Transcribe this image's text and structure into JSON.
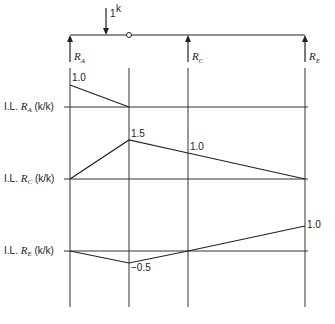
{
  "diagram": {
    "type": "influence-lines",
    "beam": {
      "load_label": "1",
      "load_unit": "k",
      "supports": [
        {
          "id": "A",
          "label": "R",
          "sub": "A",
          "x": 70
        },
        {
          "id": "C",
          "label": "R",
          "sub": "C",
          "x": 188
        },
        {
          "id": "E",
          "label": "R",
          "sub": "E",
          "x": 305
        }
      ],
      "hinge_x": 129,
      "load_x": 106
    },
    "influence_lines": [
      {
        "name": "RA",
        "label_prefix": "I.L.",
        "label_var": "R",
        "label_sub": "A",
        "label_unit": "(k/k)",
        "points": [
          {
            "pos": "A",
            "value": 1.0,
            "label": "1.0"
          },
          {
            "pos": "B-hinge",
            "value": 0.0
          },
          {
            "pos": "C",
            "value": 0.0
          },
          {
            "pos": "E",
            "value": 0.0
          }
        ]
      },
      {
        "name": "RC",
        "label_prefix": "I.L.",
        "label_var": "R",
        "label_sub": "C",
        "label_unit": "(k/k)",
        "points": [
          {
            "pos": "A",
            "value": 0.0
          },
          {
            "pos": "B-hinge",
            "value": 1.5,
            "label": "1.5"
          },
          {
            "pos": "C",
            "value": 1.0,
            "label": "1.0"
          },
          {
            "pos": "E",
            "value": 0.0
          }
        ]
      },
      {
        "name": "RE",
        "label_prefix": "I.L.",
        "label_var": "R",
        "label_sub": "E",
        "label_unit": "(k/k)",
        "points": [
          {
            "pos": "A",
            "value": 0.0
          },
          {
            "pos": "B-hinge",
            "value": -0.5,
            "label": "−0.5"
          },
          {
            "pos": "C",
            "value": 0.0
          },
          {
            "pos": "E",
            "value": 1.0,
            "label": "1.0"
          }
        ]
      }
    ]
  }
}
